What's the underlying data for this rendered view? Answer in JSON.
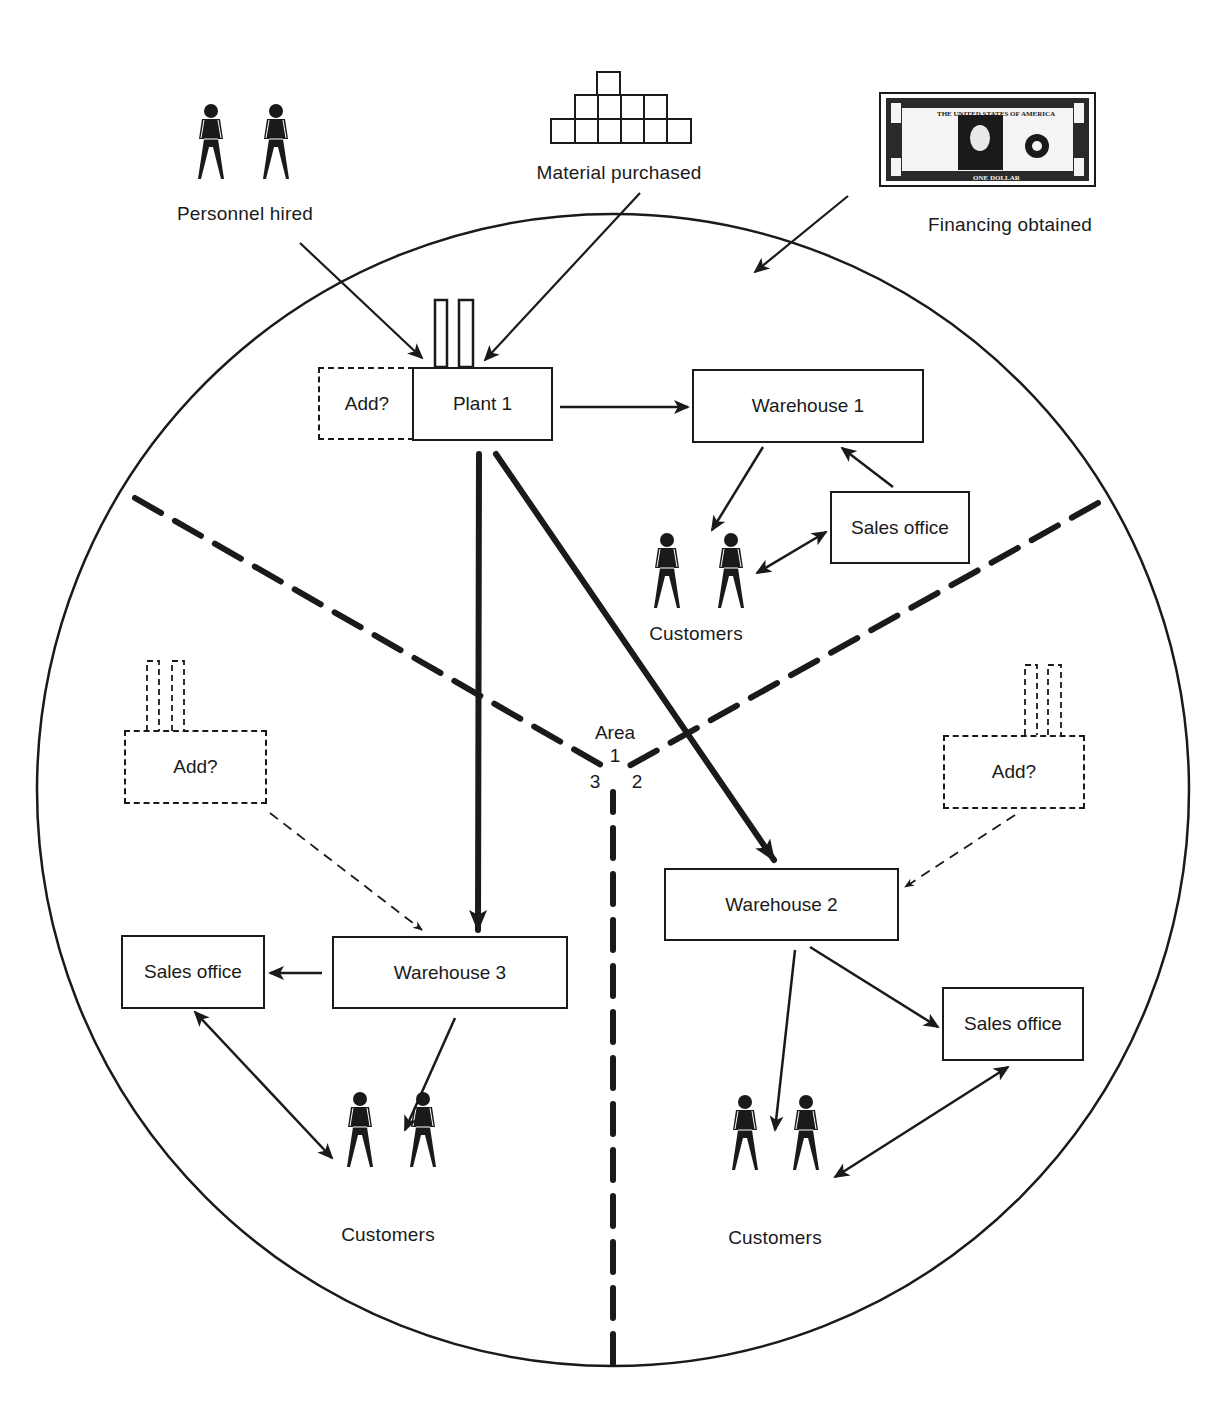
{
  "inputs": {
    "personnel": {
      "label": "Personnel hired",
      "icon": "person-pair-icon"
    },
    "material": {
      "label": "Material purchased",
      "icon": "stacked-blocks-icon"
    },
    "financing": {
      "label": "Financing obtained",
      "icon": "dollar-bill-icon"
    }
  },
  "nodes": {
    "plant1": {
      "label": "Plant 1"
    },
    "plant1_add": {
      "label": "Add?"
    },
    "warehouse1": {
      "label": "Warehouse 1"
    },
    "warehouse2": {
      "label": "Warehouse 2"
    },
    "warehouse3": {
      "label": "Warehouse 3"
    },
    "sales_office1": {
      "label": "Sales office"
    },
    "sales_office2": {
      "label": "Sales office"
    },
    "sales_office3": {
      "label": "Sales office"
    },
    "add_plant_area3": {
      "label": "Add?"
    },
    "add_plant_area2": {
      "label": "Add?"
    },
    "customers1": {
      "label": "Customers"
    },
    "customers2": {
      "label": "Customers"
    },
    "customers3": {
      "label": "Customers"
    }
  },
  "areas": {
    "title": "Area",
    "area1": "1",
    "area2": "2",
    "area3": "3"
  },
  "colors": {
    "ink": "#1a1a1a",
    "background": "#ffffff"
  }
}
